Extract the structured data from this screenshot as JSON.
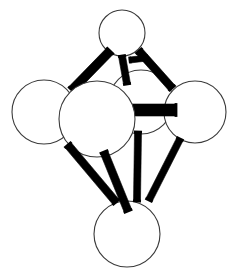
{
  "figure": {
    "subtitle": "Octahedral coordination cluster",
    "background_color": "#ffffff",
    "atom_fill_color": "#ffffff",
    "atom_outline_color": "#3a3a3a",
    "bond_color": "#000000",
    "width": 239,
    "height": 276
  },
  "atoms": [
    {
      "id": "atom-top",
      "label": "top-atom",
      "cx": 122,
      "cy": 33,
      "r": 23,
      "z": 1
    },
    {
      "id": "atom-rear-center",
      "label": "rear-center-atom",
      "cx": 141,
      "cy": 102,
      "r": 32,
      "z": 2
    },
    {
      "id": "atom-left",
      "label": "left-atom",
      "cx": 44,
      "cy": 112,
      "r": 32,
      "z": 3
    },
    {
      "id": "atom-right",
      "label": "right-atom",
      "cx": 195,
      "cy": 112,
      "r": 31,
      "z": 4
    },
    {
      "id": "atom-front-center",
      "label": "front-center-atom",
      "cx": 97,
      "cy": 119,
      "r": 38,
      "z": 6
    },
    {
      "id": "atom-bottom",
      "label": "bottom-atom",
      "cx": 127,
      "cy": 234,
      "r": 33,
      "z": 7
    }
  ],
  "bonds": [
    {
      "id": "bond-top-frontcenter",
      "label": "top-to-front-center-bond",
      "x1": 110,
      "y1": 51,
      "x2": 72,
      "y2": 90,
      "width": 9,
      "z": 5
    },
    {
      "id": "bond-top-rearcenter",
      "label": "top-to-rear-center-bond",
      "x1": 122,
      "y1": 56,
      "x2": 127,
      "y2": 84,
      "width": 7,
      "z": 5
    },
    {
      "id": "bond-top-right",
      "label": "top-to-right-bond",
      "x1": 139,
      "y1": 51,
      "x2": 172,
      "y2": 88,
      "width": 8,
      "z": 5
    },
    {
      "id": "bond-top-stub",
      "label": "top-rear-stub-bond",
      "x1": 130,
      "y1": 60,
      "x2": 147,
      "y2": 58,
      "width": 6,
      "z": 5
    },
    {
      "id": "bond-rearcenter-right",
      "label": "rear-center-to-right-bond",
      "x1": 129,
      "y1": 110,
      "x2": 176,
      "y2": 110,
      "width": 12,
      "z": 5
    },
    {
      "id": "bond-left-bottom",
      "label": "left-to-bottom-bond",
      "x1": 68,
      "y1": 145,
      "x2": 116,
      "y2": 202,
      "width": 8,
      "z": 8
    },
    {
      "id": "bond-frontcenter-bottom",
      "label": "front-center-to-bottom-bond",
      "x1": 104,
      "y1": 152,
      "x2": 128,
      "y2": 211,
      "width": 8,
      "z": 8
    },
    {
      "id": "bond-rearcenter-bottom",
      "label": "rear-center-to-bottom-bond",
      "x1": 138,
      "y1": 132,
      "x2": 137,
      "y2": 201,
      "width": 7,
      "z": 8
    },
    {
      "id": "bond-right-bottom",
      "label": "right-to-bottom-bond",
      "x1": 180,
      "y1": 139,
      "x2": 149,
      "y2": 200,
      "width": 7,
      "z": 8
    }
  ]
}
